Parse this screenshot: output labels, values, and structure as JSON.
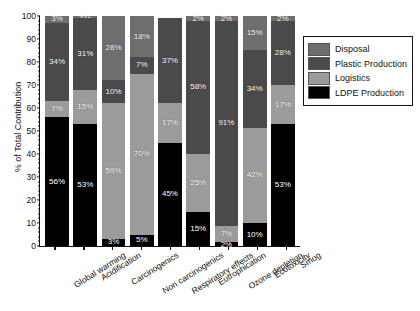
{
  "chart_data": {
    "type": "bar",
    "subtype": "stacked-percentage",
    "title": "",
    "xlabel": "",
    "ylabel": "% of Total Contribution",
    "ylim": [
      0,
      100
    ],
    "yticks": [
      0,
      10,
      20,
      30,
      40,
      50,
      60,
      70,
      80,
      90,
      100
    ],
    "grid": false,
    "legend_position": "right",
    "categories": [
      "Global warming",
      "Acidification",
      "Carcinogenics",
      "Non carcinogenics",
      "Respiratory effects",
      "Eutrophication",
      "Ozone depletion",
      "Ecotoxicity",
      "Smog"
    ],
    "series": [
      {
        "name": "LDPE Production",
        "color": "#000000",
        "values": [
          56,
          53,
          3,
          5,
          45,
          15,
          2,
          10,
          53
        ]
      },
      {
        "name": "Logistics",
        "color": "#9b9b9b",
        "values": [
          7,
          15,
          59,
          70,
          17,
          25,
          7,
          42,
          17
        ]
      },
      {
        "name": "Plastic Production",
        "color": "#4a4a4a",
        "values": [
          34,
          31,
          10,
          7,
          37,
          58,
          91,
          34,
          28
        ]
      },
      {
        "name": "Disposal",
        "color": "#6e6e6e",
        "values": [
          3,
          1,
          28,
          18,
          0,
          2,
          2,
          15,
          2
        ]
      }
    ],
    "labels": {
      "Global warming": {
        "Disposal": "3%",
        "Plastic Production": "34%",
        "Logistics": "7%",
        "LDPE Production": "56%"
      },
      "Acidification": {
        "Disposal": "1%",
        "Plastic Production": "31%",
        "Logistics": "15%",
        "LDPE Production": "53%"
      },
      "Carcinogenics": {
        "Disposal": "28%",
        "Plastic Production": "10%",
        "Logistics": "59%",
        "LDPE Production": "3%"
      },
      "Non carcinogenics": {
        "Disposal": "18%",
        "Plastic Production": "7%",
        "Logistics": "70%",
        "LDPE Production": "5%"
      },
      "Respiratory effects": {
        "Disposal": "0%",
        "Plastic Production": "37%",
        "Logistics": "17%",
        "LDPE Production": "45%"
      },
      "Eutrophication": {
        "Disposal": "2%",
        "Plastic Production": "58%",
        "Logistics": "25%",
        "LDPE Production": "15%"
      },
      "Ozone depletion": {
        "Disposal": "2%",
        "Plastic Production": "91%",
        "Logistics": "7%",
        "LDPE Production": "2%"
      },
      "Ecotoxicity": {
        "Disposal": "15%",
        "Plastic Production": "34%",
        "Logistics": "42%",
        "LDPE Production": "10%"
      },
      "Smog": {
        "Disposal": "2%",
        "Plastic Production": "28%",
        "Logistics": "17%",
        "LDPE Production": "53%"
      }
    }
  },
  "legend": {
    "items": [
      {
        "label": "Disposal",
        "color": "#6e6e6e"
      },
      {
        "label": "Plastic Production",
        "color": "#4a4a4a"
      },
      {
        "label": "Logistics",
        "color": "#9b9b9b"
      },
      {
        "label": "LDPE Production",
        "color": "#000000"
      }
    ]
  }
}
